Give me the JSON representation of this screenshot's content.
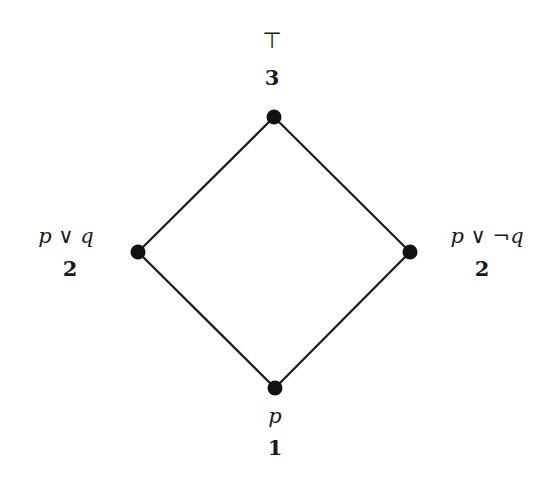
{
  "diagram": {
    "type": "lattice",
    "nodes": [
      {
        "id": "top",
        "formula": "⊤",
        "rank": "3",
        "x": 274,
        "y": 117
      },
      {
        "id": "left",
        "formula": "p ∨ q",
        "rank": "2",
        "x": 138,
        "y": 252
      },
      {
        "id": "right",
        "formula": "p ∨ ¬q",
        "rank": "2",
        "x": 410,
        "y": 252
      },
      {
        "id": "bottom",
        "formula": "p",
        "rank": "1",
        "x": 275,
        "y": 388
      }
    ],
    "edges": [
      {
        "from": "top",
        "to": "left"
      },
      {
        "from": "top",
        "to": "right"
      },
      {
        "from": "left",
        "to": "bottom"
      },
      {
        "from": "right",
        "to": "bottom"
      }
    ],
    "colors": {
      "line": "#1a1a1a",
      "node": "#111111",
      "text": "#1a1a1a"
    }
  }
}
